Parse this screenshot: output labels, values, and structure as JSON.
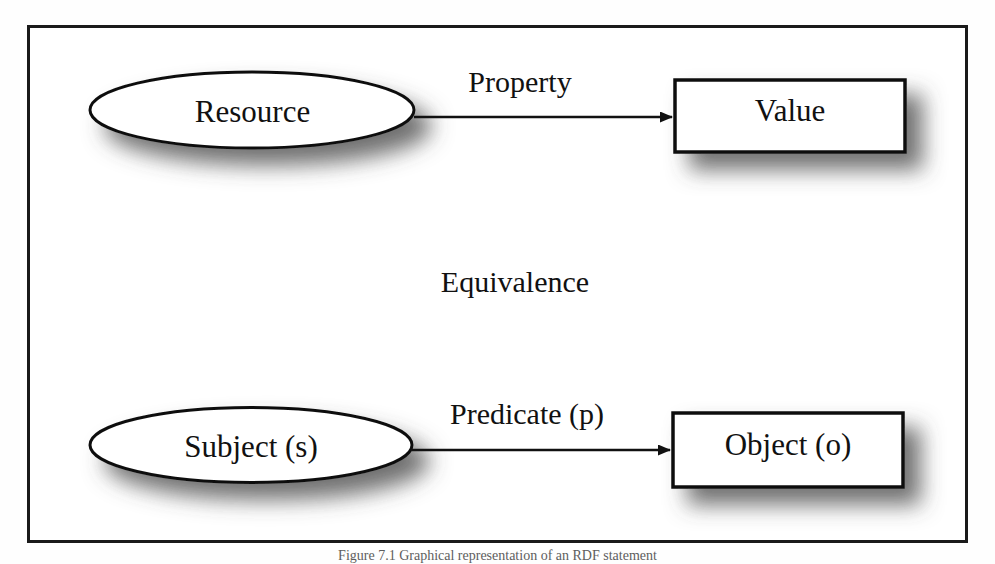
{
  "figure": {
    "caption": "Figure 7.1   Graphical representation of an RDF statement",
    "frame_color": "#1a1a1a",
    "background_color": "#ffffff",
    "stroke_color": "#111111"
  },
  "diagram": {
    "type": "node-edge-diagram",
    "nodes": [
      {
        "id": "resource",
        "label": "Resource",
        "shape": "ellipse",
        "row": "top"
      },
      {
        "id": "value",
        "label": "Value",
        "shape": "rectangle",
        "row": "top"
      },
      {
        "id": "subject",
        "label": "Subject (s)",
        "shape": "ellipse",
        "row": "bottom"
      },
      {
        "id": "object",
        "label": "Object (o)",
        "shape": "rectangle",
        "row": "bottom"
      }
    ],
    "edges": [
      {
        "id": "property",
        "label": "Property",
        "from": "resource",
        "to": "value",
        "arrow": "single"
      },
      {
        "id": "predicate",
        "label": "Predicate (p)",
        "from": "subject",
        "to": "object",
        "arrow": "single"
      }
    ],
    "annotations": [
      {
        "id": "equivalence",
        "label": "Equivalence"
      }
    ]
  }
}
